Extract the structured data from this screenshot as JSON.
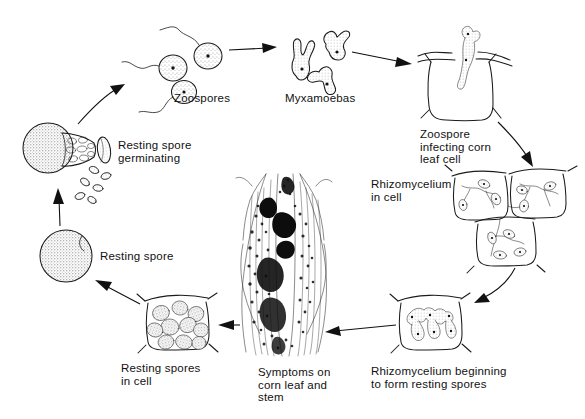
{
  "figure": {
    "background_color": "#ffffff",
    "ink_color": "#1b1b1b",
    "label_font_size_px": 11.5
  },
  "labels": {
    "zoospores": "Zoospores",
    "myxamoebas": "Myxamoebas",
    "zoospore_infecting": "Zoospore\ninfecting corn\nleaf cell",
    "rhizomycelium_in_cell": "Rhizomycelium\nin cell",
    "rhizomycelium_forming": "Rhizomycelium beginning\nto form resting spores",
    "symptoms": "Symptoms on\ncorn leaf and\nstem",
    "resting_spores_in_cell": "Resting spores\nin cell",
    "resting_spore": "Resting spore",
    "resting_spore_germinating": "Resting spore\ngerminating"
  },
  "stages": [
    {
      "id": "zoospores",
      "order": 1,
      "label": "Zoospores",
      "position": "top-left-center"
    },
    {
      "id": "myxamoebas",
      "order": 2,
      "label": "Myxamoebas",
      "position": "top-center"
    },
    {
      "id": "zoospore-infecting-corn-leaf-cell",
      "order": 3,
      "label": "Zoospore infecting corn leaf cell",
      "position": "top-right"
    },
    {
      "id": "rhizomycelium-in-cell",
      "order": 4,
      "label": "Rhizomycelium in cell",
      "position": "right"
    },
    {
      "id": "rhizomycelium-beginning-to-form-resting-spores",
      "order": 5,
      "label": "Rhizomycelium beginning to form resting spores",
      "position": "bottom-right"
    },
    {
      "id": "symptoms-on-corn-leaf-and-stem",
      "order": 6,
      "label": "Symptoms on corn leaf and stem",
      "position": "bottom-center"
    },
    {
      "id": "resting-spores-in-cell",
      "order": 7,
      "label": "Resting spores in cell",
      "position": "bottom-left"
    },
    {
      "id": "resting-spore",
      "order": 8,
      "label": "Resting spore",
      "position": "left"
    },
    {
      "id": "resting-spore-germinating",
      "order": 9,
      "label": "Resting spore germinating",
      "position": "upper-left"
    }
  ],
  "arrows": [
    {
      "from": "resting-spore-germinating",
      "to": "zoospores",
      "style": "curved"
    },
    {
      "from": "zoospores",
      "to": "myxamoebas",
      "style": "straight"
    },
    {
      "from": "myxamoebas",
      "to": "zoospore-infecting-corn-leaf-cell",
      "style": "straight"
    },
    {
      "from": "zoospore-infecting-corn-leaf-cell",
      "to": "rhizomycelium-in-cell",
      "style": "curved"
    },
    {
      "from": "rhizomycelium-in-cell",
      "to": "rhizomycelium-beginning-to-form-resting-spores",
      "style": "curved"
    },
    {
      "from": "rhizomycelium-beginning-to-form-resting-spores",
      "to": "symptoms-on-corn-leaf-and-stem",
      "style": "straight"
    },
    {
      "from": "symptoms-on-corn-leaf-and-stem",
      "to": "resting-spores-in-cell",
      "style": "straight"
    },
    {
      "from": "resting-spores-in-cell",
      "to": "resting-spore",
      "style": "straight"
    },
    {
      "from": "resting-spore",
      "to": "resting-spore-germinating",
      "style": "straight"
    }
  ]
}
